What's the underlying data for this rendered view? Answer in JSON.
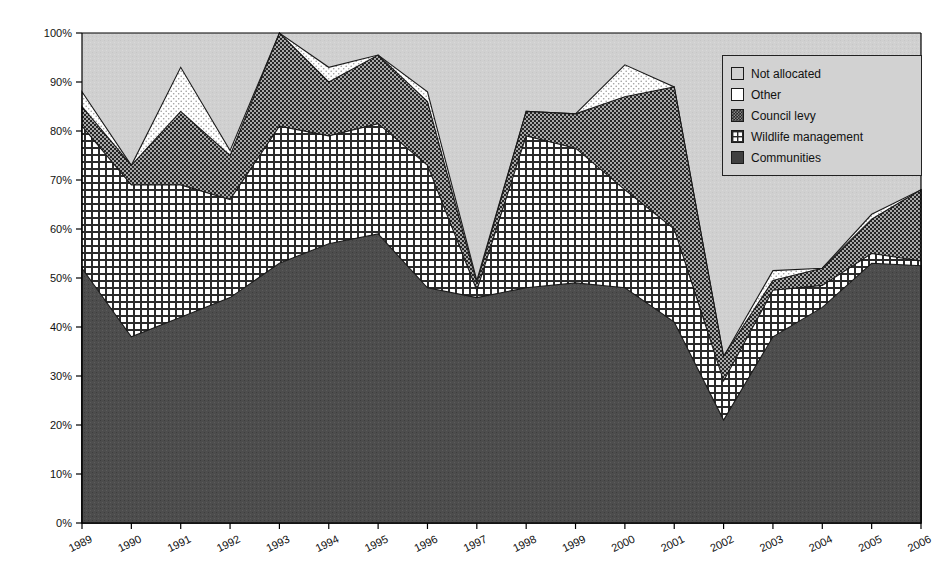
{
  "chart_data": {
    "type": "area",
    "stacked": true,
    "title": "",
    "xlabel": "",
    "ylabel": "",
    "ylim": [
      0,
      100
    ],
    "ytick_labels": [
      "0%",
      "10%",
      "20%",
      "30%",
      "40%",
      "50%",
      "60%",
      "70%",
      "80%",
      "90%",
      "100%"
    ],
    "ytick_values": [
      0,
      10,
      20,
      30,
      40,
      50,
      60,
      70,
      80,
      90,
      100
    ],
    "grid": false,
    "legend_position": "top-right",
    "categories": [
      1989,
      1990,
      1991,
      1992,
      1993,
      1994,
      1995,
      1996,
      1997,
      1998,
      1999,
      2000,
      2001,
      2002,
      2003,
      2004,
      2005,
      2006
    ],
    "x": [
      "1989",
      "1990",
      "1991",
      "1992",
      "1993",
      "1994",
      "1995",
      "1996",
      "1997",
      "1998",
      "1999",
      "2000",
      "2001",
      "2002",
      "2003",
      "2004",
      "2005",
      "2006"
    ],
    "series": [
      {
        "name": "Communities",
        "values": [
          52,
          38,
          42,
          46,
          53,
          57,
          59,
          48,
          46,
          48,
          49,
          48,
          41,
          21,
          38,
          44,
          53,
          52.5
        ],
        "cumulative": [
          52,
          38,
          42,
          46,
          53,
          57,
          59,
          48,
          46,
          48,
          49,
          48,
          41,
          21,
          38,
          44,
          53,
          52.5
        ]
      },
      {
        "name": "Wildlife management",
        "values": [
          29,
          31,
          27,
          20,
          28,
          22,
          22.5,
          25,
          1.5,
          31,
          27.5,
          20,
          19,
          8,
          9.5,
          4.5,
          2,
          1
        ],
        "cumulative": [
          81,
          69,
          69,
          66,
          81,
          79,
          81.5,
          73,
          47.5,
          79,
          76.5,
          68,
          60,
          29,
          47.5,
          48.5,
          55,
          53.5
        ]
      },
      {
        "name": "Council levy",
        "values": [
          4,
          4,
          15,
          9,
          19,
          11,
          14,
          13,
          1.5,
          5,
          7,
          19,
          29,
          5,
          2,
          3.5,
          7,
          14.5
        ],
        "cumulative": [
          85,
          73,
          84,
          75,
          100,
          90,
          95.5,
          86,
          49,
          84,
          83.5,
          87,
          89,
          34,
          49.5,
          52,
          62,
          68
        ]
      },
      {
        "name": "Other",
        "values": [
          3,
          0,
          9,
          1,
          0,
          3,
          0,
          2,
          0.5,
          0,
          0,
          6.5,
          0,
          0,
          2,
          0,
          1,
          0
        ],
        "cumulative": [
          88,
          73,
          93,
          76,
          100,
          93,
          95.5,
          88,
          49.5,
          84,
          83.5,
          93.5,
          89,
          34,
          51.5,
          52,
          63,
          68
        ]
      },
      {
        "name": "Not allocated",
        "values": [
          12,
          27,
          7,
          24,
          0,
          7,
          4.5,
          12,
          50.5,
          16,
          16.5,
          6.5,
          11,
          66,
          48.5,
          48,
          37,
          32
        ],
        "cumulative": [
          100,
          100,
          100,
          100,
          100,
          100,
          100,
          100,
          100,
          100,
          100,
          100,
          100,
          100,
          100,
          100,
          100,
          100
        ]
      }
    ],
    "colors": {
      "communities": "#4a4a4a",
      "wildlife_management": "#ffffff",
      "council_levy": "#2e2e2e",
      "other": "#ffffff",
      "not_allocated": "#cfcfcf",
      "axis": "#000000",
      "plot_background": "#cfcfcf"
    }
  },
  "legend": {
    "items": [
      {
        "label": "Not allocated",
        "pattern": "solid-light"
      },
      {
        "label": "Other",
        "pattern": "white"
      },
      {
        "label": "Council levy",
        "pattern": "dot-dark"
      },
      {
        "label": "Wildlife management",
        "pattern": "grid"
      },
      {
        "label": "Communities",
        "pattern": "solid-dark"
      }
    ],
    "background_color": "#d2d2d2",
    "border_color": "#222222"
  }
}
